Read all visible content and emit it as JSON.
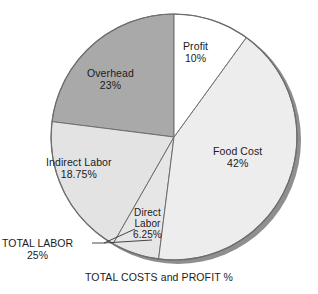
{
  "chart_data": {
    "type": "pie",
    "title": "",
    "caption": "TOTAL COSTS and PROFIT %",
    "start_angle_deg": 0,
    "direction": "clockwise",
    "center": {
      "x": 174,
      "y": 137
    },
    "radius": 123,
    "legend": "none",
    "grid": false,
    "categories": [
      "Profit",
      "Food Cost",
      "Direct Labor",
      "Indirect Labor",
      "Overhead"
    ],
    "values": [
      10,
      42,
      6.25,
      18.75,
      23
    ],
    "slices": [
      {
        "name": "Profit",
        "value": 10,
        "value_label": "10%",
        "color": "#ffffff",
        "start_deg": 0,
        "end_deg": 36,
        "label_line1": "Profit",
        "label_line2": "10%"
      },
      {
        "name": "Food Cost",
        "value": 42,
        "value_label": "42%",
        "color": "#ededed",
        "start_deg": 36,
        "end_deg": 187.2,
        "label_line1": "Food Cost",
        "label_line2": "42%"
      },
      {
        "name": "Direct Labor",
        "value": 6.25,
        "value_label": "6.25%",
        "color": "#e6e6e6",
        "start_deg": 187.2,
        "end_deg": 209.7,
        "label_line1": "Direct",
        "label_line2": "Labor",
        "label_line3": "6.25%"
      },
      {
        "name": "Indirect Labor",
        "value": 18.75,
        "value_label": "18.75%",
        "color": "#e3e3e3",
        "start_deg": 209.7,
        "end_deg": 277.2,
        "label_line1": "Indirect Labor",
        "label_line2": "18.75%"
      },
      {
        "name": "Overhead",
        "value": 23,
        "value_label": "23%",
        "color": "#a9a9a9",
        "start_deg": 277.2,
        "end_deg": 360,
        "label_line1": "Overhead",
        "label_line2": "23%"
      }
    ],
    "annotations": [
      {
        "name": "TOTAL LABOR",
        "value": 25,
        "value_label": "25%",
        "line1": "TOTAL LABOR",
        "line2": "25%",
        "points_to": [
          "Indirect Labor",
          "Direct Labor"
        ]
      }
    ],
    "colors": {
      "profit": "#ffffff",
      "food_cost": "#ededed",
      "direct_labor": "#e6e6e6",
      "indirect_labor": "#e3e3e3",
      "overhead": "#a9a9a9",
      "outline": "#6e6e6e",
      "shadow": "#8c8c8c",
      "text": "#1b1b1b",
      "background": "#ffffff"
    }
  }
}
